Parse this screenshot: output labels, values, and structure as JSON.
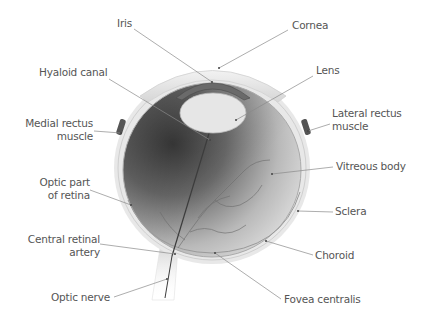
{
  "colors": {
    "background": "#ffffff",
    "label_text": "#555555",
    "leader_line": "#8a8a8a",
    "vitreous_dark": "#3a3a3a",
    "vitreous_light": "#dcdcdc",
    "sclera": "#e6e6e6"
  },
  "labels": {
    "iris": "Iris",
    "cornea": "Cornea",
    "hyaloid_canal": "Hyaloid canal",
    "lens": "Lens",
    "medial_rectus_1": "Medial rectus",
    "medial_rectus_2": "muscle",
    "lateral_rectus_1": "Lateral rectus",
    "lateral_rectus_2": "muscle",
    "vitreous_body": "Vitreous body",
    "optic_retina_1": "Optic part",
    "optic_retina_2": "of retina",
    "sclera": "Sclera",
    "central_artery_1": "Central retinal",
    "central_artery_2": "artery",
    "choroid": "Choroid",
    "optic_nerve": "Optic nerve",
    "fovea_centralis": "Fovea centralis"
  }
}
